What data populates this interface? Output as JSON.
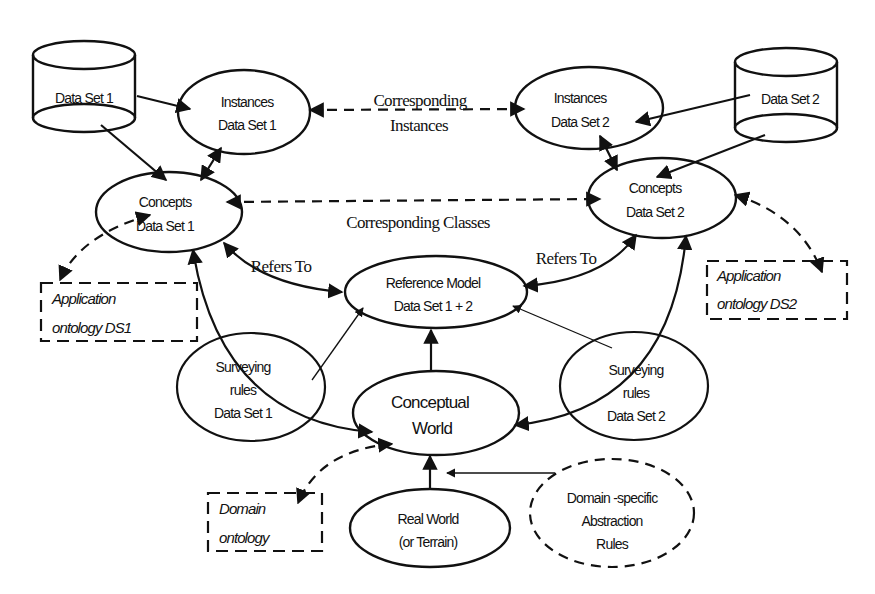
{
  "diagram": {
    "nodes": {
      "dataset1": {
        "label": "Data Set 1",
        "shape": "cylinder"
      },
      "dataset2": {
        "label": "Data Set 2",
        "shape": "cylinder"
      },
      "instances_ds1": {
        "line1": "Instances",
        "line2": "Data Set 1",
        "shape": "ellipse"
      },
      "instances_ds2": {
        "line1": "Instances",
        "line2": "Data Set 2",
        "shape": "ellipse"
      },
      "concepts_ds1": {
        "line1": "Concepts",
        "line2": "Data Set 1",
        "shape": "ellipse"
      },
      "concepts_ds2": {
        "line1": "Concepts",
        "line2": "Data Set  2",
        "shape": "ellipse"
      },
      "reference_model": {
        "line1": "Reference Model",
        "line2": "Data Set 1 + 2",
        "shape": "ellipse"
      },
      "surveying_ds1": {
        "line1": "Surveying",
        "line2": "rules",
        "line3": "Data Set 1",
        "shape": "ellipse"
      },
      "surveying_ds2": {
        "line1": "Surveying",
        "line2": "rules",
        "line3": "Data Set 2",
        "shape": "ellipse"
      },
      "conceptual_world": {
        "line1": "Conceptual",
        "line2": "World",
        "shape": "ellipse"
      },
      "real_world": {
        "line1": "Real World",
        "line2": "(or Terrain)",
        "shape": "ellipse"
      },
      "domain_specific": {
        "line1": "Domain  -specific",
        "line2": "Abstraction",
        "line3": "Rules",
        "shape": "dashed-ellipse"
      },
      "app_ontology_ds1": {
        "line1": "Application",
        "line2": "ontology DS1",
        "shape": "dashed-box"
      },
      "app_ontology_ds2": {
        "line1": "Application",
        "line2": "ontology DS2",
        "shape": "dashed-box"
      },
      "domain_ontology": {
        "line1": "Domain",
        "line2": "ontology",
        "shape": "dashed-box"
      }
    },
    "edge_labels": {
      "corresponding_instances_1": "Corresponding",
      "corresponding_instances_2": "Instances",
      "corresponding_classes": "Corresponding    Classes",
      "refers_to_left": "Refers To",
      "refers_to_right": "Refers To"
    },
    "edges": [
      {
        "from": "Data Set 1",
        "to": "Instances Data Set 1",
        "style": "solid"
      },
      {
        "from": "Data Set 1",
        "to": "Concepts Data Set 1",
        "style": "solid"
      },
      {
        "from": "Instances Data Set 1",
        "to": "Concepts Data Set 1",
        "style": "solid-bidirectional"
      },
      {
        "from": "Instances Data Set 1",
        "to": "Instances Data Set 2",
        "style": "dashed-bidirectional",
        "label": "Corresponding Instances"
      },
      {
        "from": "Data Set 2",
        "to": "Instances Data Set 2",
        "style": "solid"
      },
      {
        "from": "Data Set 2",
        "to": "Concepts Data Set 2",
        "style": "solid"
      },
      {
        "from": "Instances Data Set 2",
        "to": "Concepts Data Set 2",
        "style": "solid-bidirectional"
      },
      {
        "from": "Concepts Data Set 1",
        "to": "Concepts Data Set 2",
        "style": "dashed-bidirectional",
        "label": "Corresponding Classes"
      },
      {
        "from": "Concepts Data Set 1",
        "to": "Reference Model Data Set 1 + 2",
        "style": "solid-bidirectional",
        "label": "Refers To"
      },
      {
        "from": "Concepts Data Set 2",
        "to": "Reference Model Data Set 1 + 2",
        "style": "solid-bidirectional",
        "label": "Refers To"
      },
      {
        "from": "Concepts Data Set 1",
        "to": "Application ontology DS1",
        "style": "dashed-bidirectional"
      },
      {
        "from": "Concepts Data Set 2",
        "to": "Application ontology DS2",
        "style": "dashed-bidirectional"
      },
      {
        "from": "Conceptual World",
        "to": "Concepts Data Set 1",
        "style": "solid-bidirectional"
      },
      {
        "from": "Conceptual World",
        "to": "Concepts Data Set 2",
        "style": "solid-bidirectional"
      },
      {
        "from": "Conceptual World",
        "to": "Reference Model Data Set 1 + 2",
        "style": "solid"
      },
      {
        "from": "Surveying rules Data Set 1",
        "to": "Reference Model Data Set 1 + 2",
        "style": "thin"
      },
      {
        "from": "Surveying rules Data Set 2",
        "to": "Reference Model Data Set 1 + 2",
        "style": "thin"
      },
      {
        "from": "Real World",
        "to": "Conceptual World",
        "style": "solid"
      },
      {
        "from": "Domain-specific Abstraction Rules",
        "to": "Real World -> Conceptual World",
        "style": "thin"
      },
      {
        "from": "Conceptual World",
        "to": "Domain ontology",
        "style": "dashed-bidirectional"
      }
    ]
  }
}
